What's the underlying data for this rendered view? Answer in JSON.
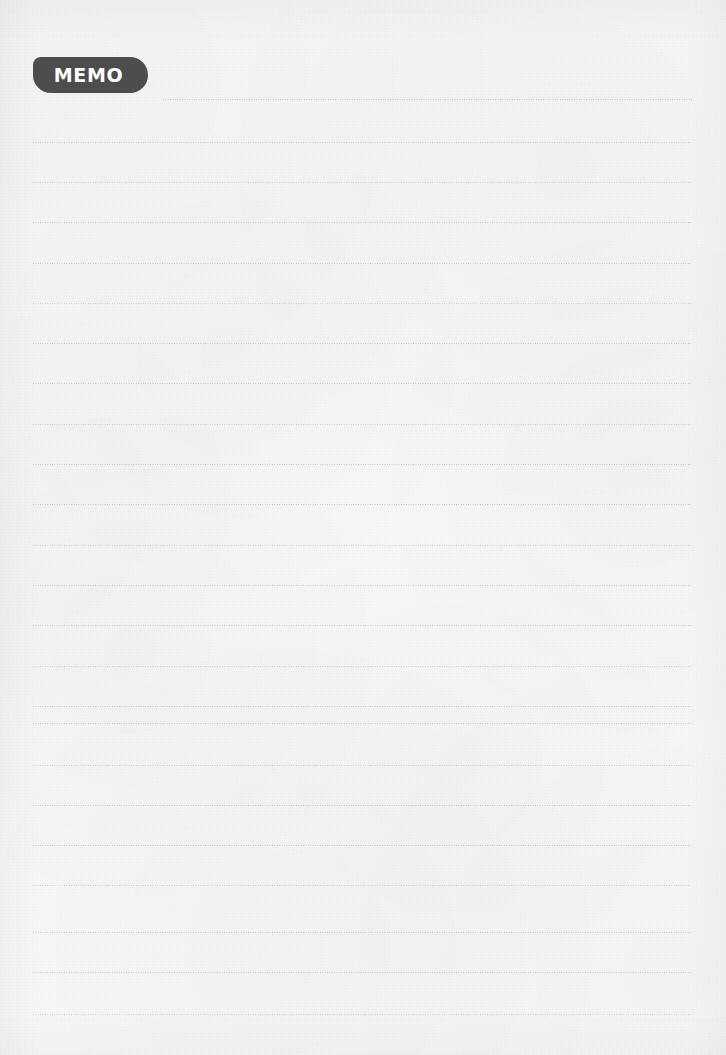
{
  "page": {
    "title": "MEMO",
    "type": "lined-memo-notepad-page",
    "width": 726,
    "height": 1055,
    "background_color": "#f7f7f6",
    "paper_texture": "subtle-fibrous-paper"
  },
  "badge": {
    "label": "MEMO",
    "background_color": "#4d4d4d",
    "text_color": "#ffffff",
    "shape": "rounded-pill",
    "x": 33,
    "y": 57,
    "width": 115,
    "height": 36
  },
  "rules": {
    "style": "dotted",
    "color": "#b9b9b9",
    "thickness_px": 1,
    "left_margin": 33,
    "right_edge": 692,
    "spacing_px": 40.3,
    "count": 24,
    "lines": [
      {
        "y": 99,
        "x_start": 163,
        "x_end": 692,
        "note": "indented beside MEMO badge"
      },
      {
        "y": 142,
        "x_start": 33,
        "x_end": 692
      },
      {
        "y": 182,
        "x_start": 33,
        "x_end": 692
      },
      {
        "y": 222,
        "x_start": 33,
        "x_end": 692
      },
      {
        "y": 263,
        "x_start": 33,
        "x_end": 692
      },
      {
        "y": 303,
        "x_start": 33,
        "x_end": 692
      },
      {
        "y": 343,
        "x_start": 33,
        "x_end": 692
      },
      {
        "y": 383,
        "x_start": 33,
        "x_end": 692
      },
      {
        "y": 424,
        "x_start": 33,
        "x_end": 692
      },
      {
        "y": 464,
        "x_start": 33,
        "x_end": 692
      },
      {
        "y": 504,
        "x_start": 33,
        "x_end": 692
      },
      {
        "y": 545,
        "x_start": 33,
        "x_end": 692
      },
      {
        "y": 585,
        "x_start": 33,
        "x_end": 692
      },
      {
        "y": 625,
        "x_start": 33,
        "x_end": 692
      },
      {
        "y": 666,
        "x_start": 33,
        "x_end": 692
      },
      {
        "y": 706,
        "x_start": 33,
        "x_end": 692
      },
      {
        "y": 723,
        "x_start": 33,
        "x_end": 692
      },
      {
        "y": 765,
        "x_start": 33,
        "x_end": 692
      },
      {
        "y": 805,
        "x_start": 33,
        "x_end": 692
      },
      {
        "y": 845,
        "x_start": 33,
        "x_end": 692
      },
      {
        "y": 885,
        "x_start": 33,
        "x_end": 692
      },
      {
        "y": 932,
        "x_start": 33,
        "x_end": 692
      },
      {
        "y": 972,
        "x_start": 33,
        "x_end": 692
      },
      {
        "y": 1014,
        "x_start": 33,
        "x_end": 692
      }
    ]
  },
  "writing_area": {
    "value": "",
    "placeholder": ""
  }
}
